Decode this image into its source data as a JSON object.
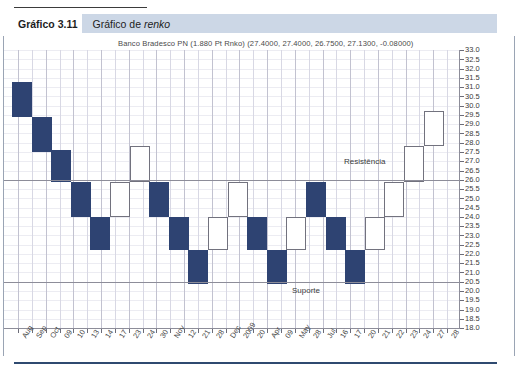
{
  "caption": {
    "number": "Gráfico 3.11",
    "text_before": "Gráfico de ",
    "text_italic": "renko"
  },
  "chart_title": "Banco Bradesco PN (1.880 Pt Rnko) (27.4000, 27.4000, 26.7500, 27.1300, -0.08000)",
  "annotations": {
    "resistance_label": "Resistência",
    "support_label": "Suporte"
  },
  "colors": {
    "brick_down": "#2e4372",
    "brick_up_border": "#72727e",
    "brick_up_fill": "#ffffff",
    "caption_band": "#ccd7e6",
    "grid": "#d8d8e4",
    "axis": "#8d8d99",
    "bottom_rule": "#2f4a70"
  },
  "chart_data": {
    "type": "bar",
    "subtype": "renko",
    "title": "Banco Bradesco PN (1.880 Pt Rnko) (27.4000, 27.4000, 26.7500, 27.1300, -0.08000)",
    "xlabel": "",
    "ylabel": "",
    "ylim": [
      18.0,
      33.0
    ],
    "ytick_step": 0.5,
    "grid": true,
    "legend": false,
    "ytick_labels": [
      "33.0",
      "32.5",
      "32.0",
      "31.5",
      "31.0",
      "30.5",
      "30.0",
      "29.5",
      "29.0",
      "28.5",
      "28.0",
      "27.5",
      "27.0",
      "26.5",
      "26.0",
      "25.5",
      "25.0",
      "24.5",
      "24.0",
      "23.5",
      "23.0",
      "22.5",
      "22.0",
      "21.5",
      "21.0",
      "20.5",
      "20.0",
      "19.5",
      "19.0",
      "18.5",
      "18.0"
    ],
    "ytick_values": [
      33.0,
      32.5,
      32.0,
      31.5,
      31.0,
      30.5,
      30.0,
      29.5,
      29.0,
      28.5,
      28.0,
      27.5,
      27.0,
      26.5,
      26.0,
      25.5,
      25.0,
      24.5,
      24.0,
      23.5,
      23.0,
      22.5,
      22.0,
      21.5,
      21.0,
      20.5,
      20.0,
      19.5,
      19.0,
      18.5,
      18.0
    ],
    "xtick_labels": [
      "Aug",
      "Sep",
      "Oct",
      "09",
      "10",
      "13",
      "14",
      "17",
      "23",
      "24",
      "30",
      "Nov",
      "12",
      "21",
      "28",
      "Dec",
      "2009",
      "20",
      "Apr",
      "09",
      "May",
      "28",
      "Jul",
      "16",
      "17",
      "20",
      "21",
      "22",
      "23",
      "24",
      "27",
      "28"
    ],
    "reference_lines": [
      {
        "name": "Resistência",
        "value": 26.0
      },
      {
        "name": "Suporte",
        "value": 20.5
      }
    ],
    "brick_height": 1.88,
    "bricks": [
      {
        "index": 0,
        "direction": "down",
        "top": 31.3,
        "bottom": 29.4
      },
      {
        "index": 1,
        "direction": "down",
        "top": 29.4,
        "bottom": 27.5
      },
      {
        "index": 2,
        "direction": "down",
        "top": 27.6,
        "bottom": 25.9
      },
      {
        "index": 3,
        "direction": "down",
        "top": 25.9,
        "bottom": 24.0
      },
      {
        "index": 4,
        "direction": "down",
        "top": 24.0,
        "bottom": 22.2
      },
      {
        "index": 5,
        "direction": "up",
        "top": 25.9,
        "bottom": 24.0
      },
      {
        "index": 6,
        "direction": "up",
        "top": 27.8,
        "bottom": 25.9
      },
      {
        "index": 7,
        "direction": "down",
        "top": 25.9,
        "bottom": 24.0
      },
      {
        "index": 8,
        "direction": "down",
        "top": 24.0,
        "bottom": 22.2
      },
      {
        "index": 9,
        "direction": "down",
        "top": 22.2,
        "bottom": 20.4
      },
      {
        "index": 10,
        "direction": "up",
        "top": 24.0,
        "bottom": 22.2
      },
      {
        "index": 11,
        "direction": "up",
        "top": 25.9,
        "bottom": 24.0
      },
      {
        "index": 12,
        "direction": "down",
        "top": 24.0,
        "bottom": 22.2
      },
      {
        "index": 13,
        "direction": "down",
        "top": 22.2,
        "bottom": 20.4
      },
      {
        "index": 14,
        "direction": "up",
        "top": 24.0,
        "bottom": 22.2
      },
      {
        "index": 15,
        "direction": "down",
        "top": 25.9,
        "bottom": 24.0
      },
      {
        "index": 16,
        "direction": "down",
        "top": 24.0,
        "bottom": 22.2
      },
      {
        "index": 17,
        "direction": "down",
        "top": 22.2,
        "bottom": 20.4
      },
      {
        "index": 18,
        "direction": "up",
        "top": 24.0,
        "bottom": 22.2
      },
      {
        "index": 19,
        "direction": "up",
        "top": 25.9,
        "bottom": 24.0
      },
      {
        "index": 20,
        "direction": "up",
        "top": 27.8,
        "bottom": 25.9
      },
      {
        "index": 21,
        "direction": "up",
        "top": 29.7,
        "bottom": 27.8
      }
    ]
  }
}
